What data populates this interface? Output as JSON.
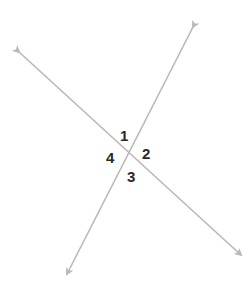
{
  "diagram": {
    "line_color": "#b8b8b8",
    "label_color": "#2a2a2a",
    "lines": [
      {
        "name": "line-a",
        "from": [
          19,
          52
        ],
        "to": [
          241,
          255
        ]
      },
      {
        "name": "line-b",
        "from": [
          193,
          27
        ],
        "to": [
          67,
          274
        ]
      }
    ],
    "angles": [
      {
        "label": "1",
        "x": 120,
        "y": 128
      },
      {
        "label": "2",
        "x": 142,
        "y": 146
      },
      {
        "label": "3",
        "x": 127,
        "y": 169
      },
      {
        "label": "4",
        "x": 106,
        "y": 150
      }
    ]
  }
}
